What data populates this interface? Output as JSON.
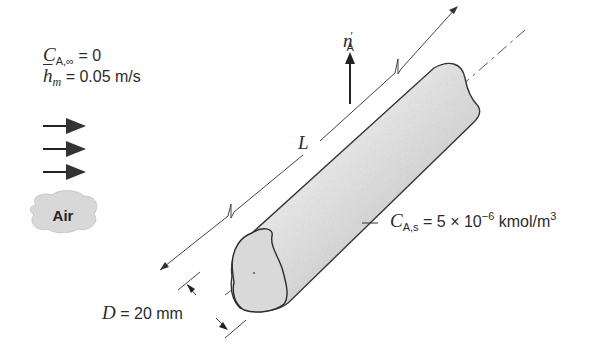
{
  "conditions": {
    "c_inf": {
      "symbol": "C",
      "subscript": "A,∞",
      "eq": "= 0"
    },
    "h_m": {
      "symbol": "h",
      "subscript": "m",
      "eq": "= 0.05 m/s"
    }
  },
  "flow": {
    "label": "Air",
    "arrow_count": 3
  },
  "flux": {
    "symbol": "n",
    "prime": "′",
    "subscript": "A"
  },
  "length": {
    "symbol": "L"
  },
  "surface": {
    "symbol": "C",
    "subscript": "A,s",
    "eq": "= 5 × 10",
    "exp": "−6",
    "unit": " kmol/m",
    "unit_exp": "3"
  },
  "diameter": {
    "symbol": "D",
    "eq": "= 20 mm"
  },
  "colors": {
    "line": "#333333",
    "cylinder_light": "#f2f2f2",
    "cylinder_dark": "#b0b0b0",
    "cloud": "#d6d6d6"
  }
}
